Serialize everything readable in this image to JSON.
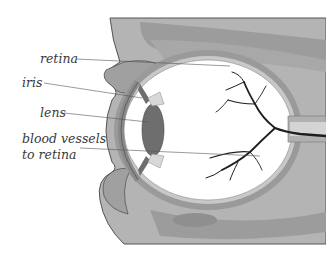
{
  "diagram": {
    "labels": [
      {
        "id": "retina",
        "text": "retina"
      },
      {
        "id": "iris",
        "text": "iris"
      },
      {
        "id": "lens",
        "text": "lens"
      },
      {
        "id": "blood-vessels",
        "lines": [
          "blood vessels",
          "to retina"
        ]
      }
    ],
    "colors": {
      "background": "#ffffff",
      "tissue_light": "#b9b9b9",
      "tissue_mid": "#a4a4a4",
      "tissue_dark": "#8f8f8f",
      "sclera": "#9a9a9a",
      "lens": "#6e6e6e",
      "vessels": "#1e1e1e",
      "leader_lines": "#555555",
      "label_text": "#3a3a3a"
    }
  }
}
